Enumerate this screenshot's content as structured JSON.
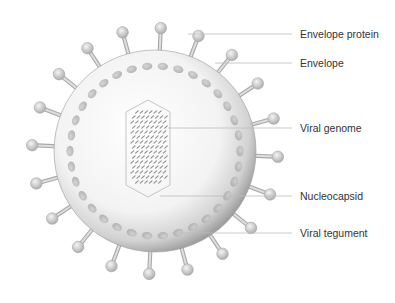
{
  "diagram": {
    "center": {
      "x": 155,
      "y": 151
    },
    "envelope_radius": 101,
    "spike_count": 20,
    "colors": {
      "envelope_light": "#fbfbfb",
      "envelope_dark": "#a8a8a8",
      "spike": "#bdbdbd",
      "tegument_bead": "#bcbcbc",
      "leader_line": "#bfbfbf",
      "label_text": "#333333"
    },
    "labels": [
      {
        "id": "envelope-protein",
        "text": "Envelope protein",
        "x": 300,
        "y": 28,
        "line_from": {
          "x": 188,
          "y": 34
        }
      },
      {
        "id": "envelope",
        "text": "Envelope",
        "x": 300,
        "y": 57,
        "line_from": {
          "x": 215,
          "y": 65
        }
      },
      {
        "id": "viral-genome",
        "text": "Viral genome",
        "x": 300,
        "y": 122,
        "line_from": {
          "x": 168,
          "y": 128
        }
      },
      {
        "id": "nucleocapsid",
        "text": "Nucleocapsid",
        "x": 300,
        "y": 190,
        "line_from": {
          "x": 160,
          "y": 199
        }
      },
      {
        "id": "viral-tegument",
        "text": "Viral tegument",
        "x": 300,
        "y": 227,
        "line_from": {
          "x": 172,
          "y": 234
        }
      }
    ]
  }
}
